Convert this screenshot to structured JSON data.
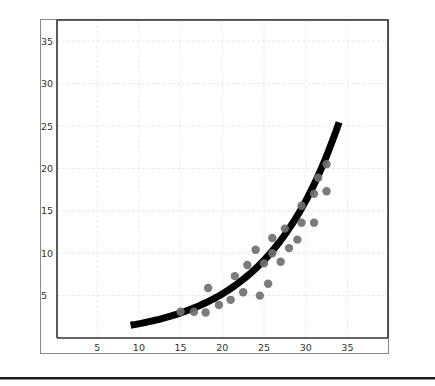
{
  "chart_data": {
    "type": "scatter",
    "title": "",
    "xlabel": "",
    "ylabel": "",
    "xlim": [
      0,
      40
    ],
    "ylim": [
      0,
      38
    ],
    "grid": true,
    "legend": null,
    "x_ticks": [
      5,
      10,
      15,
      20,
      25,
      30,
      35
    ],
    "y_ticks": [
      5,
      10,
      15,
      20,
      25,
      30,
      35
    ],
    "series": [
      {
        "name": "observations",
        "kind": "scatter",
        "color": "#707070",
        "points": [
          [
            15.0,
            3.1
          ],
          [
            16.6,
            3.1
          ],
          [
            18.0,
            3.0
          ],
          [
            18.3,
            5.9
          ],
          [
            19.6,
            3.9
          ],
          [
            21.0,
            4.5
          ],
          [
            21.5,
            7.3
          ],
          [
            22.5,
            5.4
          ],
          [
            23.0,
            8.6
          ],
          [
            24.0,
            10.4
          ],
          [
            24.5,
            5.0
          ],
          [
            25.0,
            8.8
          ],
          [
            25.5,
            6.4
          ],
          [
            26.0,
            10.0
          ],
          [
            26.0,
            11.8
          ],
          [
            27.0,
            9.0
          ],
          [
            27.5,
            12.9
          ],
          [
            28.0,
            10.6
          ],
          [
            29.0,
            11.6
          ],
          [
            29.5,
            13.6
          ],
          [
            29.5,
            15.6
          ],
          [
            31.0,
            13.6
          ],
          [
            31.0,
            17.0
          ],
          [
            31.5,
            18.9
          ],
          [
            32.5,
            17.3
          ],
          [
            32.5,
            20.5
          ]
        ]
      },
      {
        "name": "exponential fit",
        "kind": "line",
        "color": "#000000",
        "model": "y = 0.54 * exp(0.1133 * x)",
        "x_range": [
          9,
          34
        ],
        "a": 0.54,
        "b": 0.1133
      }
    ]
  },
  "frame": {
    "outer": {
      "left": 40,
      "top": 19,
      "right": 388,
      "bottom": 353
    },
    "plot": {
      "left": 57,
      "top": 20,
      "right": 388,
      "bottom": 338
    },
    "divider_y": 378
  }
}
